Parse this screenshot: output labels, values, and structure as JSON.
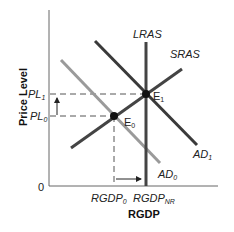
{
  "diagram": {
    "type": "AD-AS model",
    "axes": {
      "y_title": "Price Level",
      "x_title": "RGDP",
      "origin": "0"
    },
    "y_ticks": [
      {
        "base": "PL",
        "sub": "1"
      },
      {
        "base": "PL",
        "sub": "0"
      }
    ],
    "x_ticks": [
      {
        "base": "RGDP",
        "sub": "0"
      },
      {
        "base": "RGDP",
        "sub": "NR"
      }
    ],
    "curves": {
      "lras": {
        "label": "LRAS",
        "color": "#444444"
      },
      "sras": {
        "label": "SRAS",
        "color": "#444444"
      },
      "ad0": {
        "base": "AD",
        "sub": "0",
        "color": "#9a9a9a"
      },
      "ad1": {
        "base": "AD",
        "sub": "1",
        "color": "#3a3a3a"
      }
    },
    "points": {
      "e0": {
        "base": "E",
        "sub": "0"
      },
      "e1": {
        "base": "E",
        "sub": "1"
      }
    },
    "arrows": {
      "price_arrow": "up",
      "output_arrow": "right"
    }
  }
}
